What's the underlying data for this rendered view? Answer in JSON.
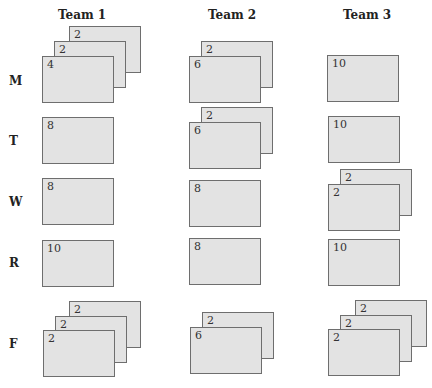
{
  "headers": [
    "Team 1",
    "Team 2",
    "Team 3"
  ],
  "rows": [
    "M",
    "T",
    "W",
    "R",
    "F"
  ],
  "cells": {
    "M": {
      "team1": [
        2,
        2,
        4
      ],
      "team2": [
        2,
        6
      ],
      "team3": [
        10
      ]
    },
    "T": {
      "team1": [
        8
      ],
      "team2": [
        2,
        6
      ],
      "team3": [
        10
      ]
    },
    "W": {
      "team1": [
        8
      ],
      "team2": [
        8
      ],
      "team3": [
        2,
        2
      ]
    },
    "R": {
      "team1": [
        10
      ],
      "team2": [
        8
      ],
      "team3": [
        10
      ]
    },
    "F": {
      "team1": [
        2,
        2,
        2
      ],
      "team2": [
        2,
        6
      ],
      "team3": [
        2,
        2,
        2
      ]
    }
  },
  "labels": {
    "h1": "Team 1",
    "h2": "Team 2",
    "h3": "Team 3",
    "rM": "M",
    "rT": "T",
    "rW": "W",
    "rR": "R",
    "rF": "F",
    "M1a": "2",
    "M1b": "2",
    "M1c": "4",
    "M2a": "2",
    "M2b": "6",
    "M3a": "10",
    "T1a": "8",
    "T2a": "2",
    "T2b": "6",
    "T3a": "10",
    "W1a": "8",
    "W2a": "8",
    "W3a": "2",
    "W3b": "2",
    "R1a": "10",
    "R2a": "8",
    "R3a": "10",
    "F1a": "2",
    "F1b": "2",
    "F1c": "2",
    "F2a": "2",
    "F2b": "6",
    "F3a": "2",
    "F3b": "2",
    "F3c": "2"
  },
  "colors": {
    "card_fill": "#e3e3e3",
    "card_border": "#6e6e6e",
    "text": "#222222"
  }
}
